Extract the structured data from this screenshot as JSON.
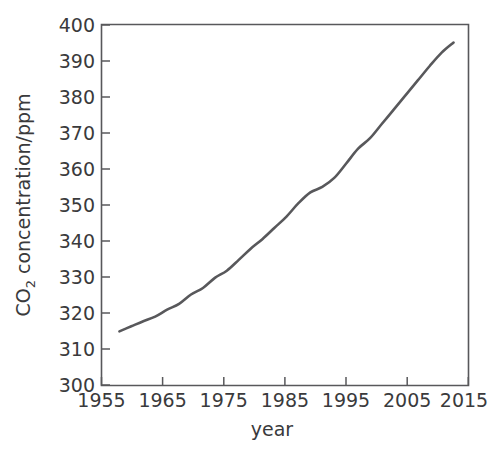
{
  "chart_data": {
    "type": "line",
    "title": "",
    "xlabel": "year",
    "ylabel": "CO2 concentration/ppm",
    "ylabel_parts": {
      "prefix": "CO",
      "subscript": "2",
      "suffix": " concentration/ppm"
    },
    "xlim": [
      1955,
      2016.5
    ],
    "ylim": [
      300,
      400
    ],
    "xticks": [
      1955,
      1965,
      1975,
      1985,
      1995,
      2005,
      2015
    ],
    "xtick_labels": [
      "1955",
      "1965",
      "1975",
      "1985",
      "1995",
      "2005",
      "2015"
    ],
    "yticks": [
      300,
      310,
      320,
      330,
      340,
      350,
      360,
      370,
      380,
      390,
      400
    ],
    "ytick_labels": [
      "300",
      "310",
      "320",
      "330",
      "340",
      "350",
      "360",
      "370",
      "380",
      "390",
      "400"
    ],
    "grid": false,
    "legend": false,
    "legend_position": "none",
    "series": [
      {
        "name": "CO2 concentration",
        "color": "#58585b",
        "x": [
          1958,
          1960,
          1962,
          1964,
          1966,
          1968,
          1970,
          1972,
          1974,
          1976,
          1978,
          1980,
          1982,
          1984,
          1986,
          1988,
          1990,
          1992,
          1994,
          1996,
          1998,
          2000,
          2002,
          2004,
          2006,
          2008,
          2010,
          2012,
          2014
        ],
        "values": [
          315.0,
          316.4,
          317.8,
          319.1,
          321.0,
          322.6,
          325.2,
          327.0,
          329.8,
          331.8,
          334.8,
          337.9,
          340.6,
          343.7,
          346.8,
          350.5,
          353.5,
          355.0,
          357.5,
          361.5,
          365.6,
          368.5,
          372.5,
          376.5,
          380.5,
          384.5,
          388.5,
          392.2,
          395.0
        ],
        "style": "solid",
        "marker": "none"
      }
    ],
    "annotations": []
  },
  "figure": {
    "background_color": "#ffffff",
    "axis_color": "#58585b",
    "text_color": "#3a3a3c",
    "line_color": "#58585b"
  }
}
